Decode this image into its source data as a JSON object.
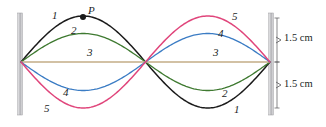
{
  "figure": {
    "kind": "standing-wave-snapshot-diagram",
    "background_color": "#ffffff"
  },
  "walls": {
    "left": {
      "label": "left-wall",
      "color": "#b8b8bc",
      "x": 17.5,
      "y": 13,
      "width": 5,
      "height": 102
    },
    "right": {
      "label": "right-wall",
      "color": "#b8b8bc",
      "x": 268.5,
      "y": 13,
      "width": 5,
      "height": 102
    }
  },
  "geometry": {
    "string_left_x": 21,
    "string_right_x": 270,
    "node_center_x": 145.5,
    "axis_y": 62,
    "max_amplitude_px": 46
  },
  "curves": [
    {
      "id": 1,
      "label": "1",
      "color": "#1a1a1a",
      "amplitude": 1.0,
      "width": 1.5
    },
    {
      "id": 2,
      "label": "2",
      "color": "#3f7a31",
      "amplitude": 0.62,
      "width": 1.3
    },
    {
      "id": 3,
      "label": "3",
      "color": "#c3ad86",
      "amplitude": 0.0,
      "width": 1.3
    },
    {
      "id": 4,
      "label": "4",
      "color": "#3b7cc4",
      "amplitude": -0.62,
      "width": 1.3
    },
    {
      "id": 5,
      "label": "5",
      "color": "#e0457b",
      "amplitude": -1.0,
      "width": 1.5
    }
  ],
  "point_p": {
    "name": "P",
    "label": "P",
    "x": 83,
    "y": 17,
    "dot_radius": 3.0,
    "color": "#1a1a1a",
    "label_x": 88,
    "label_y": 6
  },
  "curve_labels_left": [
    {
      "text": "1",
      "x": 52,
      "y": 16
    },
    {
      "text": "2",
      "x": 71,
      "y": 31
    },
    {
      "text": "3",
      "x": 87,
      "y": 52
    },
    {
      "text": "4",
      "x": 63,
      "y": 92
    },
    {
      "text": "5",
      "x": 44,
      "y": 108
    }
  ],
  "curve_labels_right": [
    {
      "text": "5",
      "x": 232,
      "y": 17
    },
    {
      "text": "4",
      "x": 218,
      "y": 33
    },
    {
      "text": "3",
      "x": 213,
      "y": 52
    },
    {
      "text": "2",
      "x": 222,
      "y": 93
    },
    {
      "text": "1",
      "x": 234,
      "y": 109
    }
  ],
  "dimensions": [
    {
      "name": "upper-amplitude",
      "text": "1.5 cm",
      "label_x": 284,
      "label_y": 38,
      "arrow_x": 277,
      "arrow_top": 18,
      "arrow_bottom": 62
    },
    {
      "name": "lower-amplitude",
      "text": "1.5 cm",
      "label_x": 284,
      "label_y": 84,
      "arrow_x": 277,
      "arrow_top": 62,
      "arrow_bottom": 108
    }
  ],
  "colors": {
    "curve_1": "#1a1a1a",
    "curve_2": "#3f7a31",
    "curve_3": "#c3ad86",
    "curve_4": "#3b7cc4",
    "curve_5": "#e0457b",
    "wall": "#b8b8bc",
    "text": "#221f1f"
  }
}
